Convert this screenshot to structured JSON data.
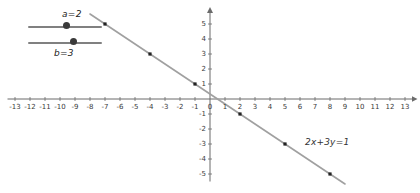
{
  "sliders": [
    {
      "name": "a",
      "label": "a=2",
      "value": 2,
      "min": 0,
      "max": 5,
      "handle_pct": 52
    },
    {
      "name": "b",
      "label": "b=3",
      "value": 3,
      "min": 0,
      "max": 5,
      "handle_pct": 62
    }
  ],
  "equation_label": "2x+3y=1",
  "chart_data": {
    "type": "line",
    "title": "",
    "xlabel": "",
    "ylabel": "",
    "equation": "2x+3y=1",
    "grid": false,
    "legend": "none",
    "xlim": [
      -13.5,
      13.5
    ],
    "ylim": [
      -5.5,
      5.8
    ],
    "xticks": [
      -13,
      -12,
      -11,
      -10,
      -9,
      -8,
      -7,
      -6,
      -5,
      -4,
      -3,
      -2,
      -1,
      0,
      1,
      2,
      3,
      4,
      5,
      6,
      7,
      8,
      9,
      10,
      11,
      12,
      13
    ],
    "xtick_labels": [
      "-13",
      "-12",
      "-11",
      "-10",
      "-9",
      "-8",
      "-7",
      "-6",
      "-5",
      "-4",
      "-3",
      "-2",
      "-1",
      "0",
      "1",
      "2",
      "3",
      "4",
      "5",
      "6",
      "7",
      "8",
      "9",
      "10",
      "11",
      "12",
      "13"
    ],
    "yticks": [
      -5,
      -4,
      -3,
      -2,
      -1,
      1,
      2,
      3,
      4,
      5
    ],
    "ytick_labels": [
      "-5",
      "-4",
      "-3",
      "-2",
      "-1",
      "1",
      "2",
      "3",
      "4",
      "5"
    ],
    "series": [
      {
        "name": "2x+3y=1",
        "color": "#a0a0a0",
        "x": [
          -8,
          9
        ],
        "y": [
          5.6667,
          -5.6667
        ],
        "points": [
          {
            "x": -7,
            "y": 5
          },
          {
            "x": -4,
            "y": 3
          },
          {
            "x": -1,
            "y": 1
          },
          {
            "x": 2,
            "y": -1
          },
          {
            "x": 5,
            "y": -3
          },
          {
            "x": 8,
            "y": -5
          }
        ],
        "point_color": "#222222"
      }
    ],
    "axis_color": "#6b6b6b",
    "origin_px": {
      "x": 210,
      "y": 99
    },
    "unit_px": 15
  }
}
